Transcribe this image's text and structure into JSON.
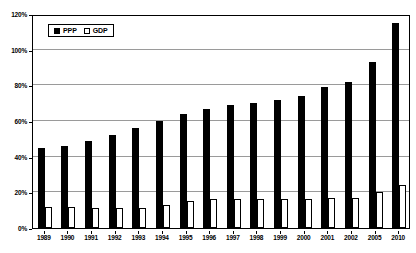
{
  "chart_data": {
    "type": "bar",
    "title": "",
    "subtitle": "",
    "xlabel": "",
    "ylabel": "",
    "ylim": [
      0,
      120
    ],
    "ytick_values": [
      0,
      20,
      40,
      60,
      80,
      100,
      120
    ],
    "ytick_labels": [
      "0%",
      "20%",
      "40%",
      "60%",
      "80%",
      "100%",
      "120%"
    ],
    "grid": true,
    "grid_axis": "y",
    "legend_position": "top-left",
    "categories": [
      "1989",
      "1990",
      "1991",
      "1992",
      "1993",
      "1994",
      "1995",
      "1996",
      "1997",
      "1998",
      "1999",
      "2000",
      "2001",
      "2002",
      "2005",
      "2010"
    ],
    "series": [
      {
        "name": "PPP",
        "color": "#000000",
        "values": [
          45,
          46,
          49,
          52,
          56,
          60,
          64,
          67,
          69,
          70,
          72,
          74,
          79,
          82,
          93,
          115
        ]
      },
      {
        "name": "GDP",
        "color": "#ffffff",
        "values": [
          12,
          12,
          11,
          11,
          11,
          13,
          15,
          16,
          16,
          16,
          16,
          16,
          17,
          17,
          20,
          24
        ]
      }
    ]
  },
  "legend": {
    "items": [
      {
        "label": "PPP",
        "swatch": "filled-square"
      },
      {
        "label": "GDP",
        "swatch": "hollow-square"
      }
    ]
  }
}
